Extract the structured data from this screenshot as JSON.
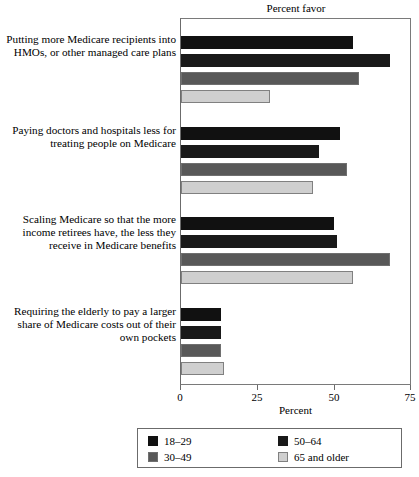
{
  "chart_data": {
    "type": "bar",
    "orientation": "horizontal",
    "title": "Percent favor",
    "xlabel": "Percent",
    "ylabel": "",
    "xlim": [
      0,
      75
    ],
    "xticks": [
      0,
      25,
      50,
      75
    ],
    "xtick_labels": [
      "0",
      "25",
      "50",
      "75"
    ],
    "grid": false,
    "legend_position": "bottom",
    "categories": [
      "Putting more Medicare recipients into HMOs, or other managed care plans",
      "Paying doctors and hospitals less for treating people on Medicare",
      "Scaling Medicare so that the more income retirees have, the less they receive in Medicare benefits",
      "Requiring the elderly to pay a larger share of Medicare costs out of their own pockets"
    ],
    "series": [
      {
        "name": "18–29",
        "color": "#111111",
        "values": [
          56,
          52,
          50,
          13
        ]
      },
      {
        "name": "30–49",
        "color": "#191919",
        "values": [
          68,
          45,
          51,
          13
        ]
      },
      {
        "name": "50–64",
        "color": "#585858",
        "values": [
          58,
          54,
          68,
          13
        ]
      },
      {
        "name": "65 and older",
        "color": "#cfcfcf",
        "values": [
          29,
          43,
          56,
          14
        ]
      }
    ]
  },
  "labels": {
    "cat0": [
      "Putting more Medicare recipients into",
      "HMOs, or other managed care plans"
    ],
    "cat1": [
      "Paying doctors and hospitals less for",
      "treating people on Medicare"
    ],
    "cat2": [
      "Scaling Medicare so that the more",
      "income retirees have, the less they",
      "receive in Medicare benefits"
    ],
    "cat3": [
      "Requiring the elderly to pay a larger",
      "share of Medicare costs out of their",
      "own pockets"
    ]
  }
}
